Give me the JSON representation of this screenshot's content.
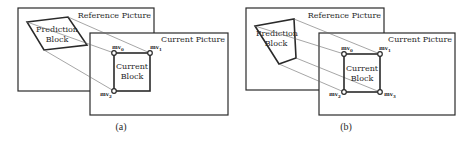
{
  "figure": {
    "panels": [
      {
        "id": "a",
        "caption": "(a)",
        "reference_picture_label": "Reference Picture",
        "current_picture_label": "Current Picture",
        "prediction_block_label_line1": "Prediction",
        "prediction_block_label_line2": "Block",
        "current_block_label_line1": "Current",
        "current_block_label_line2": "Block",
        "control_points": [
          {
            "name": "mv",
            "sub": "0"
          },
          {
            "name": "mv",
            "sub": "1"
          },
          {
            "name": "mv",
            "sub": "2"
          }
        ],
        "model": "4-parameter affine"
      },
      {
        "id": "b",
        "caption": "(b)",
        "reference_picture_label": "Reference Picture",
        "current_picture_label": "Current Picture",
        "prediction_block_label_line1": "Prediction",
        "prediction_block_label_line2": "Block",
        "current_block_label_line1": "Current",
        "current_block_label_line2": "Block",
        "control_points": [
          {
            "name": "mv",
            "sub": "0"
          },
          {
            "name": "mv",
            "sub": "1"
          },
          {
            "name": "mv",
            "sub": "2"
          },
          {
            "name": "mv",
            "sub": "3"
          }
        ],
        "model": "perspective / 4-corner"
      }
    ],
    "colors": {
      "stroke": "#2a2a2a",
      "thin_line": "#6a6a6a",
      "text": "#2a2a2a",
      "background": "#ffffff"
    }
  }
}
